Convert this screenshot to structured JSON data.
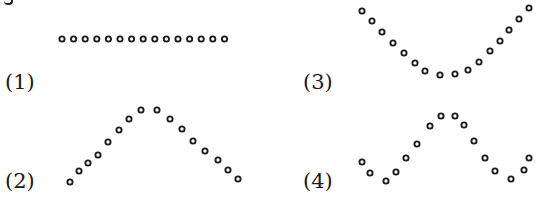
{
  "figure": {
    "dot_style": {
      "radius": 2.6,
      "stroke": 1.9,
      "color": "#1c1c1c",
      "fill": "#ffffff"
    },
    "panels": [
      {
        "label": "(1)",
        "shape": "horizontal line",
        "label_pos": {
          "x": 5,
          "y": 72
        },
        "points": [
          [
            62,
            39
          ],
          [
            73.6,
            39
          ],
          [
            85.2,
            39
          ],
          [
            96.8,
            39
          ],
          [
            108.4,
            39
          ],
          [
            120,
            39
          ],
          [
            131.6,
            39
          ],
          [
            143.2,
            39
          ],
          [
            154.8,
            39
          ],
          [
            166.4,
            39
          ],
          [
            178,
            39
          ],
          [
            189.6,
            39
          ],
          [
            201.2,
            39
          ],
          [
            212.8,
            39
          ],
          [
            224.5,
            39
          ]
        ]
      },
      {
        "label": "(2)",
        "shape": "inverted V / peak",
        "label_pos": {
          "x": 5,
          "y": 171
        },
        "points": [
          [
            70,
            182
          ],
          [
            79,
            171
          ],
          [
            88,
            163
          ],
          [
            98,
            155
          ],
          [
            108,
            142
          ],
          [
            119,
            130
          ],
          [
            129,
            119
          ],
          [
            141,
            110
          ],
          [
            157,
            110
          ],
          [
            170,
            119
          ],
          [
            182,
            129
          ],
          [
            193,
            141
          ],
          [
            205,
            151
          ],
          [
            218,
            160
          ],
          [
            228,
            170
          ],
          [
            238,
            179
          ]
        ]
      },
      {
        "label": "(3)",
        "shape": "U-shaped valley",
        "label_pos": {
          "x": 303,
          "y": 72
        },
        "points": [
          [
            362,
            11
          ],
          [
            372,
            21
          ],
          [
            382,
            32
          ],
          [
            393,
            43
          ],
          [
            404,
            53
          ],
          [
            415,
            63
          ],
          [
            425,
            71
          ],
          [
            440,
            75
          ],
          [
            455,
            74
          ],
          [
            468,
            70
          ],
          [
            479,
            62
          ],
          [
            490,
            51
          ],
          [
            500,
            41
          ],
          [
            509,
            30
          ],
          [
            519,
            19
          ],
          [
            529,
            8
          ]
        ]
      },
      {
        "label": "(4)",
        "shape": "wave (valley-peak-valley)",
        "label_pos": {
          "x": 303,
          "y": 171
        },
        "points": [
          [
            362,
            162
          ],
          [
            370,
            173
          ],
          [
            386,
            181
          ],
          [
            396,
            172
          ],
          [
            406,
            158
          ],
          [
            417,
            144
          ],
          [
            430,
            126
          ],
          [
            441,
            116
          ],
          [
            455,
            116
          ],
          [
            464,
            125
          ],
          [
            474,
            141
          ],
          [
            485,
            158
          ],
          [
            495,
            171
          ],
          [
            511,
            179
          ],
          [
            524,
            170
          ],
          [
            529,
            158
          ]
        ]
      }
    ]
  }
}
